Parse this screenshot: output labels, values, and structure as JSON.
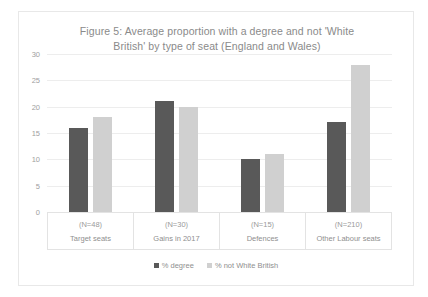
{
  "chart_data": {
    "type": "bar",
    "title": "Figure 5: Average proportion with a degree and not 'White British' by type of seat (England and Wales)",
    "title_line1": "Figure 5: Average proportion with a degree and not 'White",
    "title_line2": "British' by type of seat (England and Wales)",
    "categories": [
      "Target seats",
      "Gains in 2017",
      "Defences",
      "Other Labour seats"
    ],
    "category_counts": [
      "(N=48)",
      "(N=30)",
      "(N=15)",
      "(N=210)"
    ],
    "series": [
      {
        "name": "% degree",
        "color": "#595959",
        "values": [
          16,
          21,
          10,
          17
        ]
      },
      {
        "name": "% not White British",
        "color": "#d0d0d0",
        "values": [
          18,
          20,
          11,
          28
        ]
      }
    ],
    "xlabel": "",
    "ylabel": "",
    "ylim": [
      0,
      30
    ],
    "yticks": [
      0,
      5,
      10,
      15,
      20,
      25,
      30
    ],
    "ytick_labels": [
      "0",
      "5",
      "10",
      "15",
      "20",
      "25",
      "30"
    ],
    "grid": true,
    "legend_position": "bottom"
  }
}
